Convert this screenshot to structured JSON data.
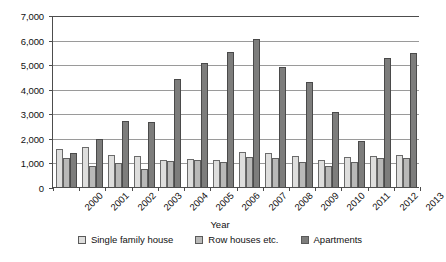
{
  "chart_data": {
    "type": "bar",
    "title": "",
    "xlabel": "Year",
    "ylabel": "",
    "ylim": [
      0,
      7000
    ],
    "ytick_step": 1000,
    "grid": true,
    "legend_position": "bottom",
    "categories": [
      "2000",
      "2001",
      "2002",
      "2003",
      "2004",
      "2005",
      "2006",
      "2007",
      "2008",
      "2009",
      "2010",
      "2011",
      "2012",
      "2013"
    ],
    "series": [
      {
        "name": "Single family house",
        "color": "#dededd",
        "values": [
          1560,
          1640,
          1310,
          1260,
          1100,
          1150,
          1110,
          1430,
          1380,
          1250,
          1080,
          1210,
          1270,
          1300
        ]
      },
      {
        "name": "Row houses etc.",
        "color": "#b9b9b8",
        "values": [
          1180,
          870,
          980,
          730,
          1040,
          1090,
          1000,
          1210,
          1180,
          1020,
          870,
          1010,
          1180,
          1190
        ]
      },
      {
        "name": "Apartments",
        "color": "#7d7d7c",
        "values": [
          1390,
          1970,
          2670,
          2640,
          4410,
          5060,
          5500,
          6040,
          4870,
          4280,
          3050,
          1890,
          5240,
          5440
        ]
      }
    ],
    "ytick_labels": [
      "0",
      "1,000",
      "2,000",
      "3,000",
      "4,000",
      "5,000",
      "6,000",
      "7,000"
    ]
  }
}
